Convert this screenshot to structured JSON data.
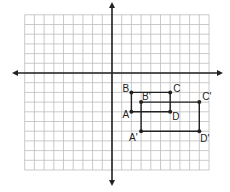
{
  "diagram": {
    "type": "coordinate-plane",
    "title": "",
    "grid": {
      "x_min": -9,
      "x_max": 10,
      "y_min": -10,
      "y_max": 6,
      "cell_px": 9.7,
      "origin_px": [
        112,
        73
      ],
      "line_color": "#bdbdbd",
      "axis_color": "#222222"
    },
    "axes": {
      "x_arrow_px": [
        14,
        221
      ],
      "y_arrow_px": [
        4,
        184
      ]
    },
    "shapes": [
      {
        "name": "ABCD",
        "vertices": [
          {
            "label": "A",
            "x": 2,
            "y": -4,
            "label_dx": -9,
            "label_dy": 6
          },
          {
            "label": "B",
            "x": 2,
            "y": -2,
            "label_dx": -9,
            "label_dy": 0
          },
          {
            "label": "C",
            "x": 6,
            "y": -2,
            "label_dx": 3,
            "label_dy": 0
          },
          {
            "label": "D",
            "x": 6,
            "y": -4,
            "label_dx": 2,
            "label_dy": 8
          }
        ]
      },
      {
        "name": "A'B'C'D'",
        "vertices": [
          {
            "label": "A'",
            "x": 3,
            "y": -6,
            "label_dx": -12,
            "label_dy": 10
          },
          {
            "label": "B'",
            "x": 3,
            "y": -3,
            "label_dx": 1,
            "label_dy": -2
          },
          {
            "label": "C'",
            "x": 9,
            "y": -3,
            "label_dx": 3,
            "label_dy": -2
          },
          {
            "label": "D'",
            "x": 9,
            "y": -6,
            "label_dx": 1,
            "label_dy": 11
          }
        ]
      }
    ],
    "stroke_color": "#222222"
  }
}
